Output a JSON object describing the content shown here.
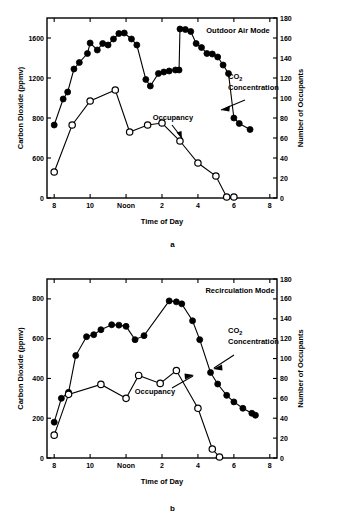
{
  "figure": {
    "panels": [
      {
        "id": "a",
        "caption": "a",
        "mode_label": "Outdoor Air Mode",
        "annotations": {
          "co2_label_line1": "CO",
          "co2_label_sub": "2",
          "co2_label_line2": "Concentration",
          "occupancy_label": "Occupancy"
        },
        "axes": {
          "xlabel": "Time of Day",
          "ylabel_left": "Carbon Dioxide (ppmv)",
          "ylabel_right": "Number of Occupants",
          "xticks": [
            "8",
            "10",
            "Noon",
            "2",
            "4",
            "6",
            "8"
          ],
          "xtick_values": [
            8,
            10,
            12,
            14,
            16,
            18,
            20
          ],
          "xlim": [
            7.6,
            20.4
          ],
          "yticks_left": [
            "0",
            "600",
            "800",
            "1200",
            "1600"
          ],
          "ytick_left_values": [
            0,
            400,
            800,
            1200,
            1600
          ],
          "ylim_left": [
            0,
            1800
          ],
          "yticks_right": [
            "0",
            "20",
            "40",
            "60",
            "80",
            "100",
            "120",
            "140",
            "160",
            "180"
          ],
          "ytick_right_values": [
            0,
            20,
            40,
            60,
            80,
            100,
            120,
            140,
            160,
            180
          ],
          "ylim_right": [
            0,
            180
          ],
          "grid": false
        },
        "chart_data": {
          "type": "line",
          "title": "Outdoor Air Mode",
          "xlabel": "Time of Day",
          "ylabel": "Carbon Dioxide (ppmv)",
          "ylabel_secondary": "Number of Occupants",
          "xlim": [
            7.6,
            20.4
          ],
          "ylim": [
            0,
            1800
          ],
          "ylim_secondary": [
            0,
            180
          ],
          "grid": false,
          "legend_position": "annotations-inline",
          "series": [
            {
              "name": "CO2 Concentration",
              "marker": "filled-circle",
              "axis": "left",
              "points": [
                {
                  "x": 8.0,
                  "y": 730
                },
                {
                  "x": 8.5,
                  "y": 990
                },
                {
                  "x": 8.75,
                  "y": 1060
                },
                {
                  "x": 9.1,
                  "y": 1290
                },
                {
                  "x": 9.4,
                  "y": 1355
                },
                {
                  "x": 9.85,
                  "y": 1445
                },
                {
                  "x": 10.0,
                  "y": 1550
                },
                {
                  "x": 10.4,
                  "y": 1480
                },
                {
                  "x": 10.7,
                  "y": 1545
                },
                {
                  "x": 11.0,
                  "y": 1530
                },
                {
                  "x": 11.3,
                  "y": 1590
                },
                {
                  "x": 11.6,
                  "y": 1645
                },
                {
                  "x": 11.9,
                  "y": 1650
                },
                {
                  "x": 12.3,
                  "y": 1590
                },
                {
                  "x": 12.6,
                  "y": 1530
                },
                {
                  "x": 13.1,
                  "y": 1185
                },
                {
                  "x": 13.35,
                  "y": 1120
                },
                {
                  "x": 13.8,
                  "y": 1245
                },
                {
                  "x": 14.1,
                  "y": 1260
                },
                {
                  "x": 14.4,
                  "y": 1270
                },
                {
                  "x": 14.75,
                  "y": 1280
                },
                {
                  "x": 14.95,
                  "y": 1280
                },
                {
                  "x": 15.0,
                  "y": 1690
                },
                {
                  "x": 15.3,
                  "y": 1685
                },
                {
                  "x": 15.6,
                  "y": 1665
                },
                {
                  "x": 15.9,
                  "y": 1545
                },
                {
                  "x": 16.2,
                  "y": 1505
                },
                {
                  "x": 16.5,
                  "y": 1445
                },
                {
                  "x": 16.8,
                  "y": 1440
                },
                {
                  "x": 17.1,
                  "y": 1410
                },
                {
                  "x": 17.4,
                  "y": 1330
                },
                {
                  "x": 17.7,
                  "y": 1245
                },
                {
                  "x": 18.0,
                  "y": 800
                },
                {
                  "x": 18.3,
                  "y": 745
                },
                {
                  "x": 18.9,
                  "y": 685
                }
              ]
            },
            {
              "name": "Occupancy",
              "marker": "open-circle",
              "axis": "right",
              "points": [
                {
                  "x": 8.0,
                  "y": 26
                },
                {
                  "x": 9.0,
                  "y": 73
                },
                {
                  "x": 10.0,
                  "y": 97
                },
                {
                  "x": 11.4,
                  "y": 108
                },
                {
                  "x": 12.2,
                  "y": 66
                },
                {
                  "x": 13.2,
                  "y": 73
                },
                {
                  "x": 14.0,
                  "y": 75
                },
                {
                  "x": 15.0,
                  "y": 57
                },
                {
                  "x": 16.0,
                  "y": 35
                },
                {
                  "x": 17.0,
                  "y": 22
                },
                {
                  "x": 17.6,
                  "y": 1
                },
                {
                  "x": 18.0,
                  "y": 1
                }
              ]
            }
          ]
        }
      },
      {
        "id": "b",
        "caption": "b",
        "mode_label": "Recirculation Mode",
        "annotations": {
          "co2_label_line1": "CO",
          "co2_label_sub": "2",
          "co2_label_line2": "Concentration",
          "occupancy_label": "Occupancy"
        },
        "axes": {
          "xlabel": "Time of Day",
          "ylabel_left": "Carbon Dioxide (ppmv)",
          "ylabel_right": "Number of Occupants",
          "xticks": [
            "8",
            "10",
            "Noon",
            "2",
            "4",
            "6",
            "8"
          ],
          "xtick_values": [
            8,
            10,
            12,
            14,
            16,
            18,
            20
          ],
          "xlim": [
            7.6,
            20.4
          ],
          "yticks_left": [
            "0",
            "200",
            "400",
            "600",
            "800"
          ],
          "ytick_left_values": [
            0,
            200,
            400,
            600,
            800
          ],
          "ylim_left": [
            0,
            900
          ],
          "yticks_right": [
            "0",
            "20",
            "40",
            "60",
            "80",
            "100",
            "120",
            "140",
            "160",
            "180"
          ],
          "ytick_right_values": [
            0,
            20,
            40,
            60,
            80,
            100,
            120,
            140,
            160,
            180
          ],
          "ylim_right": [
            0,
            180
          ],
          "grid": false
        },
        "chart_data": {
          "type": "line",
          "title": "Recirculation Mode",
          "xlabel": "Time of Day",
          "ylabel": "Carbon Dioxide (ppmv)",
          "ylabel_secondary": "Number of Occupants",
          "xlim": [
            7.6,
            20.4
          ],
          "ylim": [
            0,
            900
          ],
          "ylim_secondary": [
            0,
            180
          ],
          "grid": false,
          "legend_position": "annotations-inline",
          "series": [
            {
              "name": "CO2 Concentration",
              "marker": "filled-circle",
              "axis": "left",
              "points": [
                {
                  "x": 8.0,
                  "y": 180
                },
                {
                  "x": 8.4,
                  "y": 300
                },
                {
                  "x": 8.8,
                  "y": 330
                },
                {
                  "x": 9.2,
                  "y": 515
                },
                {
                  "x": 9.8,
                  "y": 610
                },
                {
                  "x": 10.2,
                  "y": 620
                },
                {
                  "x": 10.6,
                  "y": 645
                },
                {
                  "x": 11.2,
                  "y": 670
                },
                {
                  "x": 11.6,
                  "y": 668
                },
                {
                  "x": 12.0,
                  "y": 662
                },
                {
                  "x": 12.5,
                  "y": 595
                },
                {
                  "x": 13.0,
                  "y": 615
                },
                {
                  "x": 14.4,
                  "y": 790
                },
                {
                  "x": 14.8,
                  "y": 785
                },
                {
                  "x": 15.1,
                  "y": 775
                },
                {
                  "x": 15.7,
                  "y": 690
                },
                {
                  "x": 16.1,
                  "y": 595
                },
                {
                  "x": 16.7,
                  "y": 430
                },
                {
                  "x": 17.1,
                  "y": 372
                },
                {
                  "x": 17.6,
                  "y": 315
                },
                {
                  "x": 18.0,
                  "y": 282
                },
                {
                  "x": 18.5,
                  "y": 250
                },
                {
                  "x": 19.0,
                  "y": 225
                },
                {
                  "x": 19.2,
                  "y": 215
                }
              ]
            },
            {
              "name": "Occupancy",
              "marker": "open-circle",
              "axis": "right",
              "points": [
                {
                  "x": 8.0,
                  "y": 23
                },
                {
                  "x": 8.8,
                  "y": 64
                },
                {
                  "x": 10.6,
                  "y": 74
                },
                {
                  "x": 12.0,
                  "y": 60
                },
                {
                  "x": 12.7,
                  "y": 83
                },
                {
                  "x": 13.9,
                  "y": 75
                },
                {
                  "x": 14.8,
                  "y": 88
                },
                {
                  "x": 16.0,
                  "y": 50
                },
                {
                  "x": 16.8,
                  "y": 9
                },
                {
                  "x": 17.2,
                  "y": 1
                }
              ]
            }
          ]
        }
      }
    ]
  }
}
